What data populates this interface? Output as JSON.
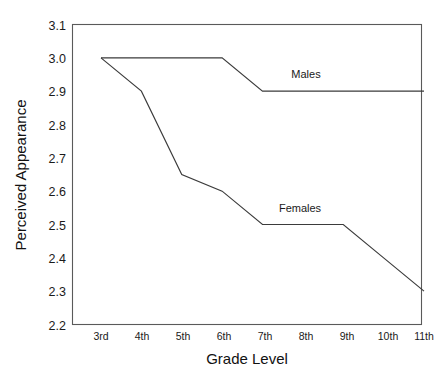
{
  "chart_data": {
    "type": "line",
    "title": "",
    "xlabel": "Grade Level",
    "ylabel": "Perceived Appearance",
    "categories": [
      "3rd",
      "4th",
      "5th",
      "6th",
      "7th",
      "8th",
      "9th",
      "10th",
      "11th"
    ],
    "ylim": [
      2.2,
      3.1
    ],
    "yticks": [
      "2.2",
      "2.3",
      "2.4",
      "2.5",
      "2.6",
      "2.7",
      "2.8",
      "2.9",
      "3.0",
      "3.1"
    ],
    "grid": false,
    "legend_position": "inline-annotation",
    "series": [
      {
        "name": "Males",
        "values": [
          3.0,
          3.0,
          3.0,
          3.0,
          2.9,
          2.9,
          2.9,
          2.9,
          2.9
        ],
        "color": "#3b3b3b",
        "label_text": "Males",
        "label_at_category": "8th"
      },
      {
        "name": "Females",
        "values": [
          3.0,
          2.9,
          2.65,
          2.6,
          2.5,
          2.5,
          2.5,
          2.4,
          2.3
        ],
        "color": "#3b3b3b",
        "label_text": "Females",
        "label_at_category": "8th"
      }
    ]
  },
  "figure": {
    "background_color": "#ffffff",
    "frame_color": "#5a5a5a",
    "x_axis_title": "Grade Level",
    "y_axis_title": "Perceived Appearance"
  }
}
